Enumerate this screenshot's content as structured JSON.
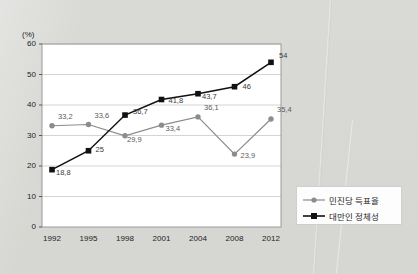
{
  "chart_data": {
    "type": "line",
    "title": "",
    "xlabel": "",
    "ylabel": "(%)",
    "categories": [
      "1992",
      "1995",
      "1998",
      "2001",
      "2004",
      "2008",
      "2012"
    ],
    "ylim": [
      0,
      60
    ],
    "ytick_step": 10,
    "yticks": [
      "0",
      "10",
      "20",
      "30",
      "40",
      "50",
      "60"
    ],
    "grid": "horizontal",
    "legend_position": "right-bottom-outside",
    "series": [
      {
        "name": "민진당 득표율",
        "marker": "circle",
        "color": "#8c8c8c",
        "values": [
          33.2,
          33.6,
          29.9,
          33.4,
          36.1,
          23.9,
          35.4
        ],
        "labels": [
          "33,2",
          "33,6",
          "29,9",
          "33,4",
          "36,1",
          "23,9",
          "35,4"
        ]
      },
      {
        "name": "대만인 정체성",
        "marker": "square",
        "color": "#111111",
        "values": [
          18.8,
          25,
          36.7,
          41.8,
          43.7,
          46,
          54
        ],
        "labels": [
          "18,8",
          "25",
          "36,7",
          "41,8",
          "43,7",
          "46",
          "54"
        ]
      }
    ]
  },
  "legend": {
    "items": [
      {
        "label": "민진당 득표율",
        "marker": "circle",
        "color": "#8c8c8c"
      },
      {
        "label": "대만인 정체성",
        "marker": "square",
        "color": "#111111"
      }
    ]
  },
  "colors": {
    "background": "#d9dad6",
    "plot_background": "#ffffff",
    "grid": "#c9c9c9",
    "frame": "#9a9a9a",
    "series_gray": "#8c8c8c",
    "series_black": "#111111",
    "text": "#1c1c1c",
    "label_text": "#5a5a5a"
  }
}
